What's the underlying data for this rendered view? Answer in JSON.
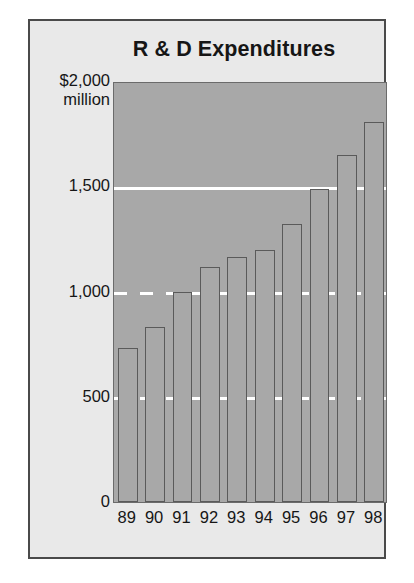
{
  "chart_data": {
    "type": "bar",
    "title": "R & D Expenditures",
    "xlabel": "",
    "ylabel": "$2,000 million",
    "categories": [
      "89",
      "90",
      "91",
      "92",
      "93",
      "94",
      "95",
      "96",
      "97",
      "98"
    ],
    "values": [
      730,
      830,
      1000,
      1115,
      1165,
      1195,
      1320,
      1485,
      1650,
      1805
    ],
    "ylim": [
      0,
      2000
    ],
    "y_ticks": [
      {
        "value": 2000,
        "label": "$2,000",
        "sublabel": "million"
      },
      {
        "value": 1500,
        "label": "1,500",
        "sublabel": ""
      },
      {
        "value": 1000,
        "label": "1,000",
        "sublabel": ""
      },
      {
        "value": 500,
        "label": "500",
        "sublabel": ""
      },
      {
        "value": 0,
        "label": "0",
        "sublabel": ""
      }
    ],
    "gridlines": [
      {
        "value": 1500,
        "style": "solid"
      },
      {
        "value": 1000,
        "style": "dashed"
      },
      {
        "value": 500,
        "style": "dashed"
      }
    ],
    "grid": true,
    "legend": null,
    "colors": {
      "panel_background": "#e9e9e9",
      "panel_border": "#4a4a4a",
      "plot_background": "#a8a8a8",
      "bar_fill": "#a8a8a8",
      "bar_border": "#5a5a5a",
      "gridline": "#ffffff",
      "text": "#161616"
    }
  }
}
